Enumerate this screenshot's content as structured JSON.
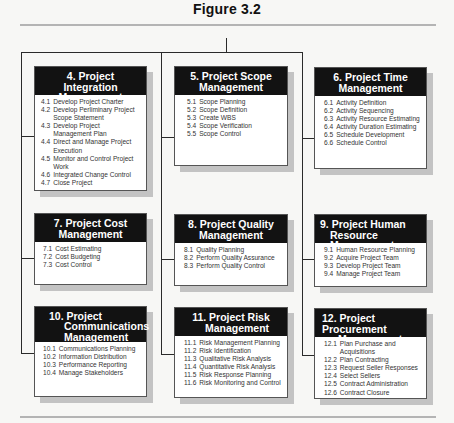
{
  "figure": {
    "title": "Figure 3.2"
  },
  "colors": {
    "header_bg": "#121212",
    "header_text": "#ffffff",
    "connector": "#2a2a2a",
    "shadow": "#c3c3c3",
    "rule": "#b4b4b4"
  },
  "areas": [
    {
      "id": "4",
      "title_lines": [
        "4. Project Integration",
        "Management"
      ],
      "items": [
        {
          "num": "4.1",
          "text": "Develop Project Charter"
        },
        {
          "num": "4.2",
          "text": "Develop Perliminary Project Scope Statement"
        },
        {
          "num": "4.3",
          "text": "Develop Project Management Plan"
        },
        {
          "num": "4.4",
          "text": "Direct and Manage Project Execution"
        },
        {
          "num": "4.5",
          "text": "Monitor and Control Project Work"
        },
        {
          "num": "4.6",
          "text": "Integrated Change Control"
        },
        {
          "num": "4.7",
          "text": "Close Project"
        }
      ]
    },
    {
      "id": "5",
      "title_lines": [
        "5. Project Scope",
        "Management"
      ],
      "items": [
        {
          "num": "5.1",
          "text": "Scope Planning"
        },
        {
          "num": "5.2",
          "text": "Scope Definition"
        },
        {
          "num": "5.3",
          "text": "Create WBS"
        },
        {
          "num": "5.4",
          "text": "Scope Verification"
        },
        {
          "num": "5.5",
          "text": "Scope Control"
        }
      ]
    },
    {
      "id": "6",
      "title_lines": [
        "6. Project Time",
        "Management"
      ],
      "items": [
        {
          "num": "6.1",
          "text": "Activity Definition"
        },
        {
          "num": "6.2",
          "text": "Activity Sequencing"
        },
        {
          "num": "6.3",
          "text": "Activity Resource Estimating"
        },
        {
          "num": "6.4",
          "text": "Activity Duration Estimating"
        },
        {
          "num": "6.5",
          "text": "Schedule Development"
        },
        {
          "num": "6.6",
          "text": "Schedule Control"
        }
      ]
    },
    {
      "id": "7",
      "title_lines": [
        "7. Project Cost",
        "Management"
      ],
      "items": [
        {
          "num": "7.1",
          "text": "Cost Estimating"
        },
        {
          "num": "7.2",
          "text": "Cost Budgeting"
        },
        {
          "num": "7.3",
          "text": "Cost Control"
        }
      ]
    },
    {
      "id": "8",
      "title_lines": [
        "8. Project Quality",
        "Management"
      ],
      "items": [
        {
          "num": "8.1",
          "text": "Quality Planning"
        },
        {
          "num": "8.2",
          "text": "Perform Quality Assurance"
        },
        {
          "num": "8.3",
          "text": "Perform Quality Control"
        }
      ]
    },
    {
      "id": "9",
      "title_lines": [
        "9. Project Human",
        "Resource Management"
      ],
      "items": [
        {
          "num": "9.1",
          "text": "Human Resource Planning"
        },
        {
          "num": "9.2",
          "text": "Acquire Project Team"
        },
        {
          "num": "9.3",
          "text": "Develop Project Team"
        },
        {
          "num": "9.4",
          "text": "Manage Project Team"
        }
      ]
    },
    {
      "id": "10",
      "title_lines": [
        "10. Project",
        "Communications",
        "Management"
      ],
      "items": [
        {
          "num": "10.1",
          "text": "Communications Planning"
        },
        {
          "num": "10.2",
          "text": "Information Distribution"
        },
        {
          "num": "10.3",
          "text": "Performance Reporting"
        },
        {
          "num": "10.4",
          "text": "Manage Stakeholders"
        }
      ]
    },
    {
      "id": "11",
      "title_lines": [
        "11. Project Risk",
        "Management"
      ],
      "items": [
        {
          "num": "11.1",
          "text": "Risk Management Planning"
        },
        {
          "num": "11.2",
          "text": "Risk Identification"
        },
        {
          "num": "11.3",
          "text": "Qualitative Risk Analysis"
        },
        {
          "num": "11.4",
          "text": "Quantitative Risk Analysis"
        },
        {
          "num": "11.5",
          "text": "Risk Response Planning"
        },
        {
          "num": "11.6",
          "text": "Risk Monitoring and Control"
        }
      ]
    },
    {
      "id": "12",
      "title_lines": [
        "12. Project Procurement",
        "Management"
      ],
      "items": [
        {
          "num": "12.1",
          "text": "Plan Purchase and Acquisitions"
        },
        {
          "num": "12.2",
          "text": "Plan Contracting"
        },
        {
          "num": "12.3",
          "text": "Request Seller Responses"
        },
        {
          "num": "12.4",
          "text": "Select Sellers"
        },
        {
          "num": "12.5",
          "text": "Contract Administration"
        },
        {
          "num": "12.6",
          "text": "Contract Closure"
        }
      ]
    }
  ]
}
